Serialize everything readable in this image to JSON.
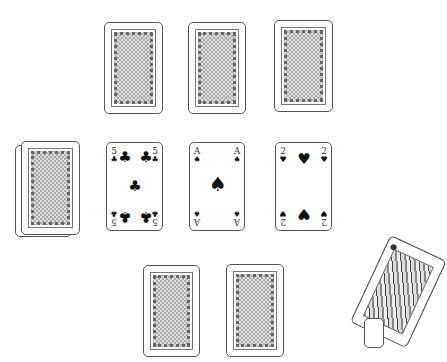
{
  "table": {
    "background": "#ffffff",
    "card_back_pattern": "gray-checker"
  },
  "top_row": [
    {
      "state": "face-down"
    },
    {
      "state": "face-down"
    },
    {
      "state": "face-down"
    }
  ],
  "middle_row": {
    "deck": {
      "state": "face-down",
      "stacked": true
    },
    "cards": [
      {
        "rank": "5",
        "suit": "clubs",
        "suit_glyph": "♣",
        "state": "face-up"
      },
      {
        "rank": "A",
        "suit": "spades",
        "suit_glyph": "♠",
        "state": "face-up"
      },
      {
        "rank": "2",
        "suit": "hearts",
        "suit_glyph": "♥",
        "state": "face-up"
      }
    ]
  },
  "bottom_row": [
    {
      "state": "face-down"
    },
    {
      "state": "face-down"
    }
  ],
  "dragged_card": {
    "state": "face-up",
    "type": "court-card",
    "rotation_deg": 25,
    "partially_offscreen": true
  }
}
